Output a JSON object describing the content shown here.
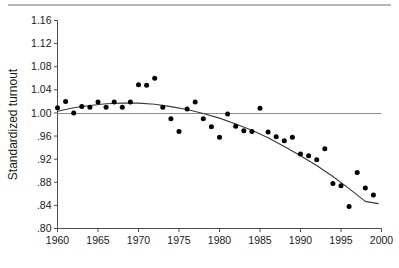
{
  "figure": {
    "background_color": "#ffffff",
    "top_rule_color": "#b7b7b7",
    "axis_color": "#4d4d4d",
    "point_color": "#000000",
    "curve_color": "#3a3a3a",
    "reference_line_color": "#8c8c8c"
  },
  "chart_data": {
    "type": "scatter",
    "title": "",
    "subtitle": "",
    "xlabel": "",
    "ylabel": "Standardized turnout",
    "xlim": [
      1960,
      2000
    ],
    "ylim": [
      0.8,
      1.16
    ],
    "grid": false,
    "legend": null,
    "x_ticks": [
      1960,
      1965,
      1970,
      1975,
      1980,
      1985,
      1990,
      1995,
      2000
    ],
    "x_tick_labels": [
      "1960",
      "1965",
      "1970",
      "1975",
      "1980",
      "1985",
      "1990",
      "1995",
      "2000"
    ],
    "y_ticks": [
      0.8,
      0.84,
      0.88,
      0.92,
      0.96,
      1.0,
      1.04,
      1.08,
      1.12,
      1.16
    ],
    "y_tick_labels": [
      ".80",
      ".84",
      ".88",
      ".92",
      ".96",
      "1.00",
      "1.04",
      "1.08",
      "1.12",
      "1.16"
    ],
    "reference_line": {
      "y": 0.999,
      "label": ""
    },
    "series": [
      {
        "name": "Standardized turnout",
        "marker": "filled-circle",
        "x": [
          1960,
          1961,
          1962,
          1963,
          1964,
          1965,
          1966,
          1967,
          1968,
          1969,
          1970,
          1971,
          1972,
          1973,
          1974,
          1975,
          1976,
          1977,
          1978,
          1979,
          1980,
          1981,
          1982,
          1983,
          1984,
          1985,
          1986,
          1987,
          1988,
          1989,
          1990,
          1991,
          1992,
          1993,
          1994,
          1995,
          1996,
          1997,
          1998,
          1999
        ],
        "y": [
          1.009,
          1.02,
          1.0,
          1.011,
          1.01,
          1.019,
          1.01,
          1.019,
          1.01,
          1.019,
          1.049,
          1.048,
          1.06,
          1.01,
          0.99,
          0.968,
          1.007,
          1.019,
          0.99,
          0.976,
          0.958,
          0.998,
          0.977,
          0.969,
          0.968,
          1.008,
          0.967,
          0.959,
          0.952,
          0.958,
          0.929,
          0.926,
          0.919,
          0.938,
          0.878,
          0.874,
          0.838,
          0.897,
          0.87,
          0.858
        ]
      }
    ],
    "fitted_curve": {
      "name": "quadratic fit",
      "x": [
        1960,
        1962,
        1964,
        1966,
        1968,
        1970,
        1972,
        1974,
        1976,
        1978,
        1980,
        1982,
        1984,
        1986,
        1988,
        1990,
        1992,
        1994,
        1996,
        1998,
        1999.6
      ],
      "y": [
        1.003,
        1.009,
        1.013,
        1.016,
        1.017,
        1.017,
        1.015,
        1.011,
        1.006,
        0.999,
        0.991,
        0.981,
        0.97,
        0.957,
        0.942,
        0.926,
        0.909,
        0.89,
        0.869,
        0.847,
        0.843
      ]
    }
  }
}
